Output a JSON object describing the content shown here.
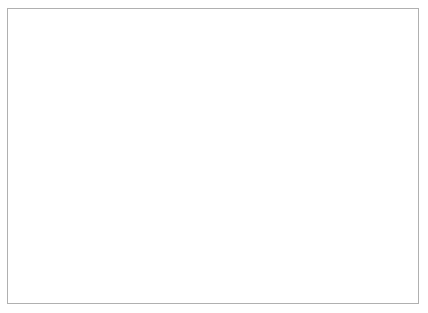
{
  "figure": {
    "ylabel": "annual incidence (thousands)",
    "xlabel": "year",
    "annotation": {
      "line1": "vaccine",
      "line2": "introduced"
    }
  },
  "colors": {
    "axis": "#6e6e6e",
    "line": "#9a9a9a",
    "text": "#4f4f4f",
    "border": "#b0b0b0",
    "arrow_outline": "#9a9a9a",
    "arrow_fill": "#ffffff",
    "background": "#ffffff"
  },
  "chart_data": {
    "type": "line",
    "title": "",
    "xlabel": "year",
    "ylabel": "annual incidence (thousands)",
    "x": [
      1960,
      1961,
      1962,
      1963,
      1964,
      1965,
      1966,
      1967,
      1968,
      1969,
      1970,
      1971,
      1972,
      1973,
      1974,
      1975,
      1976,
      1977,
      1978,
      1979,
      1980,
      1981,
      1982,
      1983,
      1984,
      1985,
      1986
    ],
    "values": [
      0.47,
      1.7,
      0.42,
      1.57,
      0.31,
      1.27,
      0.44,
      0.32,
      0.3,
      0.17,
      0.07,
      0.34,
      0.05,
      0.03,
      0.02,
      0.06,
      0.4,
      0.14,
      0.03,
      0.05,
      0.09,
      0.04,
      0.13,
      0.17,
      0.04,
      0.06,
      0.06
    ],
    "xlim": [
      1960,
      1986
    ],
    "ylim": [
      0,
      1.8
    ],
    "xticks": {
      "values": [
        1960,
        1963,
        1966,
        1969,
        1972,
        1975,
        1978,
        1981,
        1984
      ],
      "labels": [
        "1960",
        "1963",
        "1966",
        "1969",
        "1972",
        "1975",
        "1978",
        "1981",
        "1984"
      ]
    },
    "yticks": {
      "values": [
        0,
        0.2,
        0.4,
        0.6,
        0.8,
        1.0,
        1.2,
        1.4,
        1.6,
        1.8
      ],
      "labels": [
        "0",
        "0.2",
        "0.4",
        "0.6",
        "0.8",
        "1.0",
        "1.2",
        "1.4",
        "1.6",
        "1.8"
      ]
    },
    "grid": false,
    "legend": false,
    "annotations": [
      {
        "text": "vaccine introduced",
        "arrow": "down",
        "x": 1966.2,
        "arrow_tip_y": 1.17,
        "arrow_top_y": 1.52
      }
    ]
  }
}
